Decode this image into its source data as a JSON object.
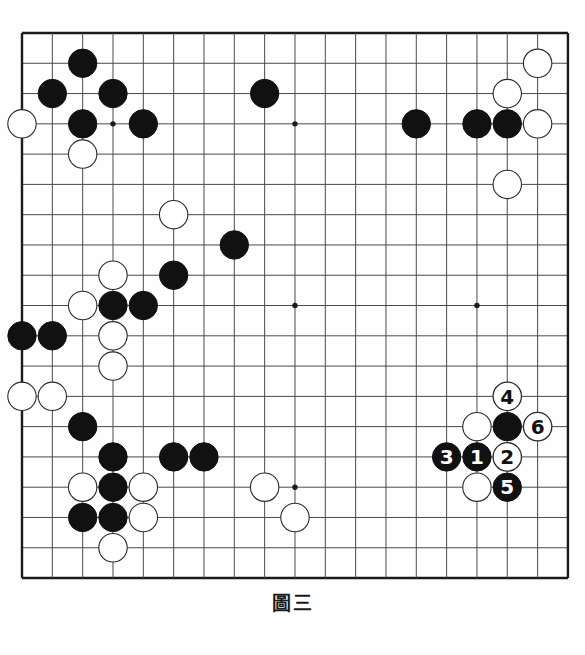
{
  "figure": {
    "caption": "圖三",
    "caption_roman": "Figure 3",
    "board_size": 19,
    "line_color": "#4a4a4a",
    "border_color": "#1a1a1a",
    "black_color": "#111111",
    "white_color": "#ffffff",
    "board_color": "#fefefe",
    "label_black_text_color": "#ffffff",
    "label_white_text_color": "#111111"
  },
  "board": {
    "columns": 19,
    "rows": 19,
    "star_points": [
      {
        "x": 3,
        "y": 3
      },
      {
        "x": 9,
        "y": 3
      },
      {
        "x": 15,
        "y": 3
      },
      {
        "x": 3,
        "y": 9
      },
      {
        "x": 9,
        "y": 9
      },
      {
        "x": 15,
        "y": 9
      },
      {
        "x": 3,
        "y": 15
      },
      {
        "x": 9,
        "y": 15
      },
      {
        "x": 15,
        "y": 15
      }
    ],
    "stones": [
      {
        "x": 2,
        "y": 1,
        "color": "black"
      },
      {
        "x": 1,
        "y": 2,
        "color": "black"
      },
      {
        "x": 3,
        "y": 2,
        "color": "black"
      },
      {
        "x": 8,
        "y": 2,
        "color": "black"
      },
      {
        "x": 0,
        "y": 3,
        "color": "white"
      },
      {
        "x": 2,
        "y": 3,
        "color": "black"
      },
      {
        "x": 4,
        "y": 3,
        "color": "black"
      },
      {
        "x": 2,
        "y": 4,
        "color": "white"
      },
      {
        "x": 17,
        "y": 1,
        "color": "white"
      },
      {
        "x": 16,
        "y": 2,
        "color": "white"
      },
      {
        "x": 13,
        "y": 3,
        "color": "black"
      },
      {
        "x": 15,
        "y": 3,
        "color": "black"
      },
      {
        "x": 16,
        "y": 3,
        "color": "black"
      },
      {
        "x": 17,
        "y": 3,
        "color": "white"
      },
      {
        "x": 16,
        "y": 5,
        "color": "white"
      },
      {
        "x": 5,
        "y": 6,
        "color": "white"
      },
      {
        "x": 7,
        "y": 7,
        "color": "black"
      },
      {
        "x": 3,
        "y": 8,
        "color": "white"
      },
      {
        "x": 5,
        "y": 8,
        "color": "black"
      },
      {
        "x": 2,
        "y": 9,
        "color": "white"
      },
      {
        "x": 3,
        "y": 9,
        "color": "black"
      },
      {
        "x": 4,
        "y": 9,
        "color": "black"
      },
      {
        "x": 0,
        "y": 10,
        "color": "black"
      },
      {
        "x": 1,
        "y": 10,
        "color": "black"
      },
      {
        "x": 3,
        "y": 10,
        "color": "white"
      },
      {
        "x": 3,
        "y": 11,
        "color": "white"
      },
      {
        "x": 0,
        "y": 12,
        "color": "white"
      },
      {
        "x": 1,
        "y": 12,
        "color": "white"
      },
      {
        "x": 2,
        "y": 13,
        "color": "black"
      },
      {
        "x": 3,
        "y": 14,
        "color": "black"
      },
      {
        "x": 5,
        "y": 14,
        "color": "black"
      },
      {
        "x": 6,
        "y": 14,
        "color": "black"
      },
      {
        "x": 2,
        "y": 15,
        "color": "white"
      },
      {
        "x": 3,
        "y": 15,
        "color": "black"
      },
      {
        "x": 4,
        "y": 15,
        "color": "white"
      },
      {
        "x": 8,
        "y": 15,
        "color": "white"
      },
      {
        "x": 2,
        "y": 16,
        "color": "black"
      },
      {
        "x": 3,
        "y": 16,
        "color": "black"
      },
      {
        "x": 4,
        "y": 16,
        "color": "white"
      },
      {
        "x": 3,
        "y": 17,
        "color": "white"
      },
      {
        "x": 9,
        "y": 16,
        "color": "white"
      },
      {
        "x": 15,
        "y": 13,
        "color": "white"
      },
      {
        "x": 16,
        "y": 13,
        "color": "black"
      },
      {
        "x": 15,
        "y": 15,
        "color": "white"
      }
    ],
    "numbered_moves": [
      {
        "n": "1",
        "x": 15,
        "y": 14,
        "color": "black"
      },
      {
        "n": "2",
        "x": 16,
        "y": 14,
        "color": "white"
      },
      {
        "n": "3",
        "x": 14,
        "y": 14,
        "color": "black"
      },
      {
        "n": "4",
        "x": 16,
        "y": 12,
        "color": "white"
      },
      {
        "n": "5",
        "x": 16,
        "y": 15,
        "color": "black"
      },
      {
        "n": "6",
        "x": 17,
        "y": 13,
        "color": "white"
      }
    ]
  }
}
